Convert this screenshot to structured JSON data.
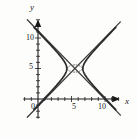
{
  "figure": {
    "name": "hyperbola-graph",
    "background": "#fdfdfc",
    "ink": "#2b2b2b"
  },
  "axes": {
    "x_axis_label": "x",
    "y_axis_label": "y",
    "origin_label": "0",
    "x_ticks": [
      {
        "value": 5,
        "label": "5"
      },
      {
        "value": 10,
        "label": "10"
      }
    ],
    "y_ticks": [
      {
        "value": 5,
        "label": "5"
      },
      {
        "value": 10,
        "label": "10"
      }
    ]
  },
  "chart_data": {
    "type": "line",
    "title": "",
    "xlabel": "x",
    "ylabel": "y",
    "xlim": [
      -2.2,
      12.4
    ],
    "ylim": [
      -3.2,
      13.2
    ],
    "grid": false,
    "legend": null,
    "annotations": [],
    "tick_labels": {
      "x": [
        "5",
        "10"
      ],
      "y": [
        "5",
        "10"
      ]
    },
    "tick_values": {
      "x": [
        5,
        10
      ],
      "y": [
        5,
        10
      ]
    },
    "minor_ticks": {
      "x_step": 1,
      "y_step": 1
    },
    "series": [
      {
        "name": "hyperbola-right-branch",
        "style": "solid",
        "color": "#2b2b2b",
        "equation": "(x-5.5)^2/1.2^2 - (y-5)^2/1.35^2 = 1, x >= 6.7",
        "center": [
          5.5,
          5
        ],
        "a": 1.2,
        "b": 1.35,
        "orientation": "horizontal",
        "vertex": [
          6.7,
          5
        ],
        "points": [
          [
            6.7,
            5.0
          ],
          [
            6.8,
            5.53
          ],
          [
            7.0,
            6.06
          ],
          [
            7.4,
            6.79
          ],
          [
            8.0,
            7.62
          ],
          [
            8.8,
            8.59
          ],
          [
            9.8,
            9.73
          ],
          [
            11.0,
            11.07
          ],
          [
            12.2,
            12.4
          ],
          [
            6.8,
            4.47
          ],
          [
            7.0,
            3.94
          ],
          [
            7.4,
            3.21
          ],
          [
            8.0,
            2.38
          ],
          [
            8.8,
            1.41
          ],
          [
            9.8,
            0.27
          ],
          [
            11.0,
            -1.07
          ],
          [
            12.2,
            -2.4
          ]
        ]
      },
      {
        "name": "hyperbola-left-branch",
        "style": "solid",
        "color": "#2b2b2b",
        "equation": "(x-5.5)^2/1.2^2 - (y-5)^2/1.35^2 = 1, x <= 4.3",
        "center": [
          5.5,
          5
        ],
        "a": 1.2,
        "b": 1.35,
        "orientation": "horizontal",
        "vertex": [
          4.3,
          5
        ],
        "points": [
          [
            4.3,
            5.0
          ],
          [
            4.2,
            5.53
          ],
          [
            4.0,
            6.06
          ],
          [
            3.6,
            6.79
          ],
          [
            3.0,
            7.62
          ],
          [
            2.2,
            8.59
          ],
          [
            1.2,
            9.73
          ],
          [
            0.0,
            11.07
          ],
          [
            -1.2,
            12.4
          ],
          [
            4.2,
            4.47
          ],
          [
            4.0,
            3.94
          ],
          [
            3.6,
            3.21
          ],
          [
            3.0,
            2.38
          ],
          [
            2.2,
            1.41
          ],
          [
            1.2,
            0.27
          ],
          [
            0.0,
            -1.07
          ],
          [
            -1.2,
            -2.4
          ]
        ]
      },
      {
        "name": "asymptote-positive-slope",
        "style": "thin-solid",
        "color": "#3a3a3a",
        "equation": "y = 5 + 1.125(x - 5.5)",
        "points": [
          [
            -1.6,
            -2.99
          ],
          [
            12.3,
            12.65
          ]
        ]
      },
      {
        "name": "asymptote-negative-slope",
        "style": "thin-solid",
        "color": "#3a3a3a",
        "equation": "y = 5 - 1.125(x - 5.5)",
        "points": [
          [
            -1.6,
            12.99
          ],
          [
            12.3,
            -2.65
          ]
        ]
      },
      {
        "name": "conjugate-dotted-arcs",
        "style": "dotted",
        "color": "#6b6b6b",
        "note": "faint dotted arcs between the two vertices near the center",
        "points": [
          [
            4.3,
            5.0
          ],
          [
            4.7,
            5.4
          ],
          [
            5.1,
            5.55
          ],
          [
            5.5,
            5.6
          ],
          [
            5.9,
            5.55
          ],
          [
            6.3,
            5.4
          ],
          [
            6.7,
            5.0
          ],
          [
            4.3,
            5.0
          ],
          [
            4.7,
            4.6
          ],
          [
            5.1,
            4.45
          ],
          [
            5.5,
            4.4
          ],
          [
            5.9,
            4.45
          ],
          [
            6.3,
            4.6
          ],
          [
            6.7,
            5.0
          ]
        ]
      }
    ]
  }
}
